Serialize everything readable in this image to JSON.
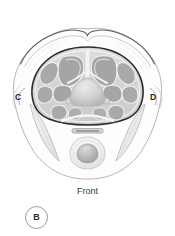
{
  "figure": {
    "panel_letter": "B",
    "orientation_label": "Front",
    "left_marker": "C",
    "right_marker": "D",
    "view": "transverse cross-section",
    "background_color": "#ffffff"
  },
  "labels": {
    "left_plane_marker": "C",
    "right_plane_marker": "D",
    "bottom_orientation": "Front",
    "panel_id": "B"
  },
  "palette": {
    "outline_dark": "#2b2b2b",
    "outline_mid": "#7d7d7d",
    "outline_light": "#b9b9b9",
    "muscle_fill": "#a8a8a8",
    "muscle_fill_light": "#c2c2c2",
    "septum_fill": "#f1f1f1",
    "cavity_fill": "#d6d6d6",
    "body_fill": "#fdfdfd",
    "sliver_fill": "#ececec",
    "vertebra_fill": "#cfcfcf",
    "cord_fill": "#b5b5b5",
    "sternum_fill": "#d0d0d0",
    "text_color": "#2a2a2a"
  },
  "structures": {
    "body_outline": "skin and subcutaneous contour with bilateral shoulder humps",
    "lateral_slivers": "paired elongated lateral muscle bellies",
    "thoracic_ring": "dark bordered inner cavity ring",
    "muscle_lobes": "radially arranged gray muscle and organ lobes",
    "central_dome": "central vertebral body dome",
    "sternum_bar": "thin horizontal bar anterior to cavity",
    "anterior_oval": "rounded anterior oval structure with inner nucleus"
  }
}
